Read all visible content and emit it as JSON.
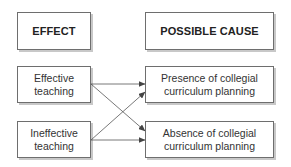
{
  "headers": {
    "effect": "EFFECT",
    "cause": "POSSIBLE CAUSE"
  },
  "effects": [
    {
      "label": "Effective\nteaching"
    },
    {
      "label": "Ineffective\nteaching"
    }
  ],
  "causes": [
    {
      "label": "Presence of collegial\ncurriculum planning"
    },
    {
      "label": "Absence of collegial\ncurriculum planning"
    }
  ],
  "arrows": [
    {
      "from": "Effective teaching",
      "to": "Presence of collegial curriculum planning"
    },
    {
      "from": "Effective teaching",
      "to": "Absence of collegial curriculum planning"
    },
    {
      "from": "Ineffective teaching",
      "to": "Presence of collegial curriculum planning"
    },
    {
      "from": "Ineffective teaching",
      "to": "Absence of collegial curriculum planning"
    }
  ],
  "colors": {
    "border": "#6e6e6e",
    "shadow": "#c8c8c8",
    "arrow": "#444444"
  }
}
